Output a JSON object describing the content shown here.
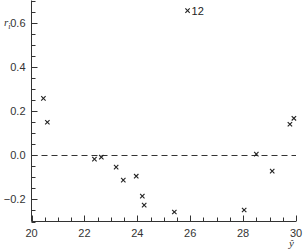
{
  "chart_data": {
    "type": "scatter",
    "title": "",
    "xlabel": "ŷ",
    "ylabel": "r_i",
    "xlim": [
      20,
      30
    ],
    "ylim": [
      -0.3,
      0.7
    ],
    "x_ticks": [
      20,
      22,
      24,
      26,
      28,
      30
    ],
    "x_tick_labels": [
      "20",
      "22",
      "24",
      "26",
      "28",
      "30"
    ],
    "y_ticks": [
      -0.2,
      0.0,
      0.2,
      0.4,
      0.6
    ],
    "y_tick_labels": [
      "−0.2",
      "0.0",
      "0.2",
      "0.4",
      "0.6"
    ],
    "grid": false,
    "legend": null,
    "reference_line": {
      "y": 0.0,
      "style": "dashed"
    },
    "marker": "x",
    "series": [
      {
        "name": "residuals",
        "points": [
          {
            "x": 20.45,
            "y": 0.257
          },
          {
            "x": 20.6,
            "y": 0.149
          },
          {
            "x": 22.38,
            "y": -0.018
          },
          {
            "x": 22.64,
            "y": -0.009
          },
          {
            "x": 23.2,
            "y": -0.054
          },
          {
            "x": 23.47,
            "y": -0.113
          },
          {
            "x": 23.96,
            "y": -0.095
          },
          {
            "x": 24.19,
            "y": -0.185
          },
          {
            "x": 24.26,
            "y": -0.226
          },
          {
            "x": 25.4,
            "y": -0.257
          },
          {
            "x": 25.9,
            "y": 0.654,
            "label": "12"
          },
          {
            "x": 28.04,
            "y": -0.248
          },
          {
            "x": 28.5,
            "y": 0.005
          },
          {
            "x": 29.1,
            "y": -0.072
          },
          {
            "x": 29.77,
            "y": 0.14
          },
          {
            "x": 29.92,
            "y": 0.167
          }
        ]
      }
    ]
  }
}
